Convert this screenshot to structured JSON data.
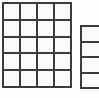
{
  "page": {
    "background_color": "#fdfdfd",
    "width": 99,
    "height": 98
  },
  "style": {
    "line_color": "#3c3c3c",
    "cell_fill": "#fbfbfb",
    "line_width_px": 2
  },
  "grids": [
    {
      "name": "primary-grid",
      "columns": 4,
      "rows": 5,
      "clipped": false,
      "x": 2,
      "y": 2,
      "width": 70,
      "height": 86,
      "cells": [
        [
          "",
          "",
          "",
          ""
        ],
        [
          "",
          "",
          "",
          ""
        ],
        [
          "",
          "",
          "",
          ""
        ],
        [
          "",
          "",
          "",
          ""
        ],
        [
          "",
          "",
          "",
          ""
        ]
      ]
    },
    {
      "name": "secondary-grid",
      "columns": 1,
      "rows": 4,
      "clipped": true,
      "clipped_edge": "right",
      "x": 80,
      "y": 25,
      "width": 28,
      "height": 64,
      "cells": [
        [
          ""
        ],
        [
          ""
        ],
        [
          ""
        ],
        [
          ""
        ]
      ]
    }
  ]
}
